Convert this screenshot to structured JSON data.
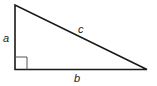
{
  "diagram": {
    "type": "right-triangle",
    "labels": {
      "a": "a",
      "b": "b",
      "c": "c"
    },
    "colors": {
      "stroke": "#1a1a1a",
      "right_angle_marker": "#555555",
      "label": "#222222"
    }
  }
}
